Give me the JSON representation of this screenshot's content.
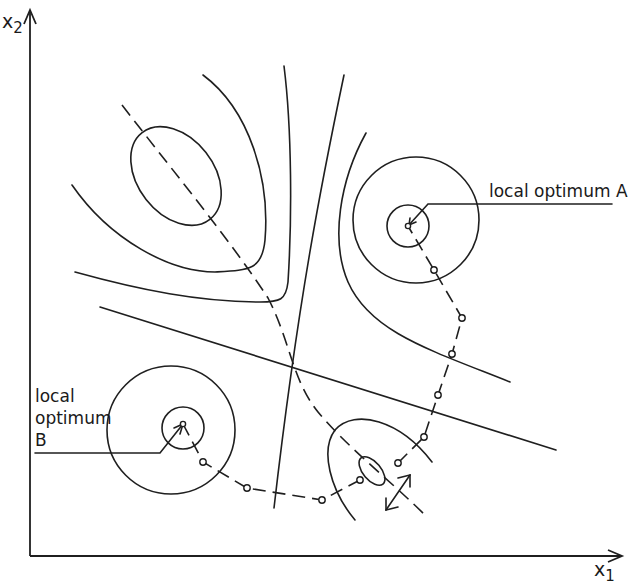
{
  "figure": {
    "type": "contour-diagram",
    "axes": {
      "x_label": {
        "base": "x",
        "sub": "1"
      },
      "y_label": {
        "base": "x",
        "sub": "2"
      }
    },
    "annotations": {
      "optimum_a": "local optimum A",
      "optimum_b_line1": "local",
      "optimum_b_line2": "optimum",
      "optimum_b_line3": "B"
    },
    "colors": {
      "ink": "#1f1f1f",
      "background": "#ffffff"
    },
    "paths": {
      "path_to_a_steps": 6,
      "path_to_b_steps": 5
    }
  }
}
